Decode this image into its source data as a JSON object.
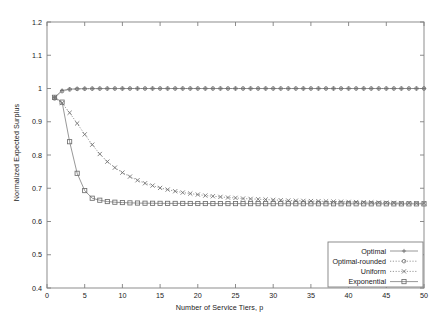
{
  "chart_data": {
    "type": "line",
    "title": "",
    "xlabel": "Number of Service Tiers, p",
    "ylabel": "Normalized Expected Surplus",
    "xlim": [
      0,
      50
    ],
    "ylim": [
      0.4,
      1.2
    ],
    "xticks": [
      0,
      5,
      10,
      15,
      20,
      25,
      30,
      35,
      40,
      45,
      50
    ],
    "xticklabels": [
      "0",
      "5",
      "10",
      "15",
      "20",
      "25",
      "30",
      "35",
      "40",
      "45",
      "50"
    ],
    "yticks": [
      0.4,
      0.5,
      0.6,
      0.7,
      0.8,
      0.9,
      1.0,
      1.1,
      1.2
    ],
    "yticklabels": [
      "0.4",
      "0.5",
      "0.6",
      "0.7",
      "0.8",
      "0.9",
      "1",
      "1.1",
      "1.2"
    ],
    "grid": false,
    "legend_position": "lower right",
    "line_color": "#7d7d7d",
    "marker_color": "#6e6e6e",
    "axis_color": "#808080",
    "x": [
      1,
      2,
      3,
      4,
      5,
      6,
      7,
      8,
      9,
      10,
      11,
      12,
      13,
      14,
      15,
      16,
      17,
      18,
      19,
      20,
      21,
      22,
      23,
      24,
      25,
      26,
      27,
      28,
      29,
      30,
      31,
      32,
      33,
      34,
      35,
      36,
      37,
      38,
      39,
      40,
      41,
      42,
      43,
      44,
      45,
      46,
      47,
      48,
      49,
      50
    ],
    "series": [
      {
        "name": "Optimal",
        "marker": "plus",
        "linestyle": "solid",
        "values": [
          0.9735,
          0.994,
          0.998,
          0.9991,
          0.9995,
          0.9997,
          0.9998,
          0.9999,
          0.9999,
          0.9999,
          1.0,
          1.0,
          1.0,
          1.0,
          1.0,
          1.0,
          1.0,
          1.0,
          1.0,
          1.0,
          1.0,
          1.0,
          1.0,
          1.0,
          1.0,
          1.0,
          1.0,
          1.0,
          1.0,
          1.0,
          1.0,
          1.0,
          1.0,
          1.0,
          1.0,
          1.0,
          1.0,
          1.0,
          1.0,
          1.0,
          1.0,
          1.0,
          1.0,
          1.0,
          1.0,
          1.0,
          1.0,
          1.0,
          1.0,
          1.0
        ]
      },
      {
        "name": "Optimal-rounded",
        "marker": "circle",
        "linestyle": "dotted",
        "values": [
          0.97,
          0.992,
          0.9972,
          0.9987,
          0.9993,
          0.9996,
          0.9997,
          0.9998,
          0.9999,
          0.9999,
          0.9999,
          1.0,
          1.0,
          1.0,
          1.0,
          1.0,
          1.0,
          1.0,
          1.0,
          1.0,
          1.0,
          1.0,
          1.0,
          1.0,
          1.0,
          1.0,
          1.0,
          1.0,
          1.0,
          1.0,
          1.0,
          1.0,
          1.0,
          1.0,
          1.0,
          1.0,
          1.0,
          1.0,
          1.0,
          1.0,
          1.0,
          1.0,
          1.0,
          1.0,
          1.0,
          1.0,
          1.0,
          1.0,
          1.0,
          1.0
        ]
      },
      {
        "name": "Uniform",
        "marker": "x",
        "linestyle": "dotted",
        "values": [
          0.972,
          0.956,
          0.927,
          0.895,
          0.862,
          0.831,
          0.803,
          0.78,
          0.762,
          0.747,
          0.735,
          0.724,
          0.715,
          0.708,
          0.701,
          0.696,
          0.691,
          0.687,
          0.684,
          0.681,
          0.678,
          0.676,
          0.674,
          0.672,
          0.671,
          0.669,
          0.668,
          0.667,
          0.666,
          0.665,
          0.664,
          0.663,
          0.6625,
          0.662,
          0.6615,
          0.661,
          0.6605,
          0.66,
          0.6595,
          0.659,
          0.6585,
          0.658,
          0.6575,
          0.657,
          0.6565,
          0.656,
          0.6555,
          0.6552,
          0.655,
          0.6548
        ]
      },
      {
        "name": "Exponential",
        "marker": "square",
        "linestyle": "solid",
        "values": [
          0.9735,
          0.959,
          0.84,
          0.745,
          0.693,
          0.67,
          0.664,
          0.66,
          0.658,
          0.657,
          0.656,
          0.6555,
          0.655,
          0.6548,
          0.6546,
          0.6545,
          0.6544,
          0.6543,
          0.6542,
          0.6541,
          0.654,
          0.654,
          0.6539,
          0.6539,
          0.6538,
          0.6538,
          0.6537,
          0.6537,
          0.6536,
          0.6536,
          0.6536,
          0.6535,
          0.6535,
          0.6535,
          0.6534,
          0.6534,
          0.6534,
          0.6533,
          0.6533,
          0.6533,
          0.6533,
          0.6532,
          0.6532,
          0.6532,
          0.6532,
          0.6531,
          0.6531,
          0.6531,
          0.6531,
          0.653
        ]
      }
    ],
    "legend": [
      "Optimal",
      "Optimal-rounded",
      "Uniform",
      "Exponential"
    ]
  }
}
